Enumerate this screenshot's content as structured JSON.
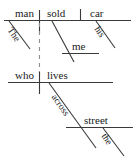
{
  "diagram": {
    "type": "reed-kellogg-sentence-diagram",
    "sentence": "The man who lives across the street sold me his car",
    "stroke_color": "#3a3a3a",
    "text_color": "#1a1a1a",
    "background_color": "#ffffff",
    "words": {
      "subject": "man",
      "verb": "sold",
      "direct_object": "car",
      "subject_article": "The",
      "indirect_object": "me",
      "object_possessive": "his",
      "relative_pronoun": "who",
      "relative_verb": "lives",
      "preposition": "across",
      "prep_object": "street",
      "prep_object_article": "the"
    },
    "lines": {
      "main_baseline": "solid-horizontal",
      "subject_verb_divider": "solid-vertical-crossing",
      "verb_object_divider": "solid-vertical-partial",
      "relative_clause_link": "dashed-vertical",
      "modifier_slants": "solid-diagonal"
    }
  }
}
